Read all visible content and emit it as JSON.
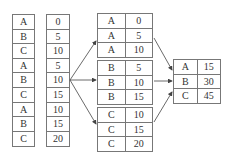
{
  "input": {
    "keys": [
      "A",
      "B",
      "C",
      "A",
      "B",
      "C",
      "A",
      "B",
      "C"
    ],
    "values": [
      "0",
      "5",
      "10",
      "5",
      "10",
      "15",
      "10",
      "15",
      "20"
    ]
  },
  "groups": [
    {
      "rows": [
        [
          "A",
          "0"
        ],
        [
          "A",
          "5"
        ],
        [
          "A",
          "10"
        ]
      ]
    },
    {
      "rows": [
        [
          "B",
          "5"
        ],
        [
          "B",
          "10"
        ],
        [
          "B",
          "15"
        ]
      ]
    },
    {
      "rows": [
        [
          "C",
          "10"
        ],
        [
          "C",
          "15"
        ],
        [
          "C",
          "20"
        ]
      ]
    }
  ],
  "result": {
    "rows": [
      [
        "A",
        "15"
      ],
      [
        "B",
        "30"
      ],
      [
        "C",
        "45"
      ]
    ]
  }
}
